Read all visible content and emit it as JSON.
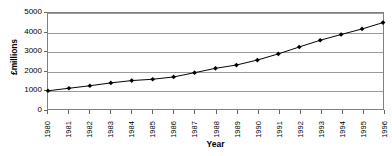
{
  "chart_data": {
    "type": "line",
    "title": "",
    "xlabel": "Year",
    "ylabel": "£millions",
    "categories": [
      "1980",
      "1981",
      "1982",
      "1983",
      "1984",
      "1985",
      "1986",
      "1987",
      "1988",
      "1989",
      "1990",
      "1991",
      "1992",
      "1993",
      "1994",
      "1995",
      "1996"
    ],
    "values": [
      950,
      1080,
      1210,
      1360,
      1480,
      1550,
      1670,
      1890,
      2120,
      2290,
      2550,
      2870,
      3230,
      3580,
      3880,
      4170,
      4500
    ],
    "series": [
      {
        "name": "£millions",
        "values": [
          950,
          1080,
          1210,
          1360,
          1480,
          1550,
          1670,
          1890,
          2120,
          2290,
          2550,
          2870,
          3230,
          3580,
          3880,
          4170,
          4500
        ]
      }
    ],
    "ylim": [
      0,
      5000
    ],
    "yticks": [
      0,
      1000,
      2000,
      3000,
      4000,
      5000
    ],
    "ytick_labels": [
      "0",
      "1000",
      "2000",
      "3000",
      "4000",
      "5000"
    ],
    "grid": "horizontal",
    "legend": "none",
    "marker": "diamond",
    "line_color": "#000000",
    "marker_color": "#000000",
    "grid_color": "#9a9a9a",
    "plot_border_color": "#808080",
    "background": "#ffffff"
  }
}
